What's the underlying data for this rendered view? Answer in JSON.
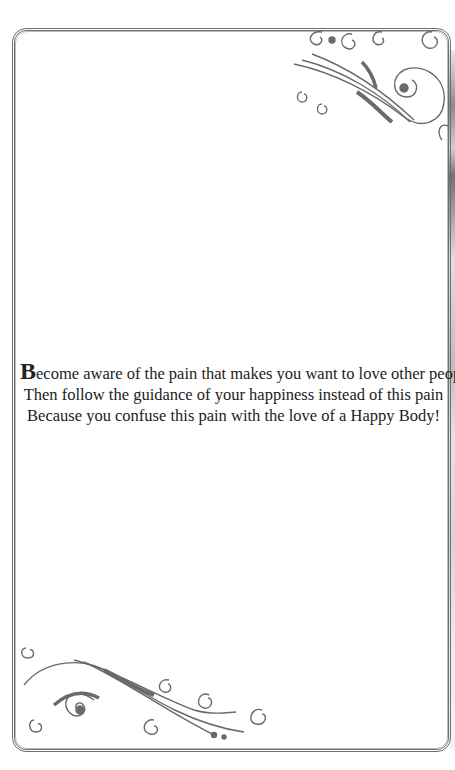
{
  "page": {
    "background": "#ffffff",
    "border_color": "#6e6e6e",
    "ornament_color": "#6a6a6a"
  },
  "ornaments": {
    "top_right": "flourish-swirl-icon",
    "bottom_left": "flourish-swirl-icon"
  },
  "poem": {
    "drop_cap": "B",
    "lines": [
      "ecome aware of the pain that makes you want to love other people",
      "Then follow the guidance of your happiness instead of this pain",
      "Because you confuse this pain with the love of a Happy Body!"
    ]
  }
}
